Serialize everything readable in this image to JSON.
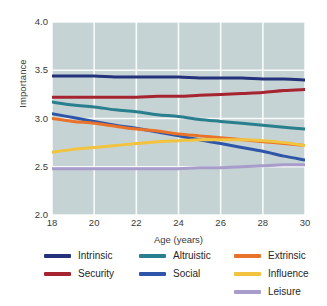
{
  "chart_data": {
    "type": "line",
    "title": "",
    "xlabel": "Age (years)",
    "ylabel": "Importance",
    "xlim": [
      18,
      30
    ],
    "ylim": [
      2.0,
      4.0
    ],
    "xticks": [
      "18",
      "20",
      "22",
      "24",
      "26",
      "28",
      "30"
    ],
    "yticks": [
      "2.0",
      "2.5",
      "3.0",
      "3.5",
      "4.0"
    ],
    "grid": true,
    "legend_position": "bottom",
    "plot_background": "#c6d3d4",
    "x": [
      18,
      19,
      20,
      21,
      22,
      23,
      24,
      25,
      26,
      27,
      28,
      29,
      30
    ],
    "series": [
      {
        "name": "Intrinsic",
        "color": "#24327c",
        "values": [
          3.44,
          3.44,
          3.44,
          3.43,
          3.43,
          3.43,
          3.43,
          3.42,
          3.42,
          3.42,
          3.41,
          3.41,
          3.4
        ]
      },
      {
        "name": "Security",
        "color": "#a6242f",
        "values": [
          3.22,
          3.22,
          3.22,
          3.22,
          3.22,
          3.23,
          3.23,
          3.24,
          3.25,
          3.26,
          3.27,
          3.29,
          3.3
        ]
      },
      {
        "name": "Altruistic",
        "color": "#2a7f8e",
        "values": [
          3.17,
          3.14,
          3.12,
          3.09,
          3.07,
          3.04,
          3.02,
          2.99,
          2.97,
          2.95,
          2.93,
          2.91,
          2.89
        ]
      },
      {
        "name": "Social",
        "color": "#2f55a8",
        "values": [
          3.05,
          3.01,
          2.97,
          2.93,
          2.9,
          2.86,
          2.82,
          2.78,
          2.74,
          2.7,
          2.66,
          2.61,
          2.57
        ]
      },
      {
        "name": "Extrinsic",
        "color": "#e8722a",
        "values": [
          3.0,
          2.97,
          2.95,
          2.92,
          2.89,
          2.87,
          2.84,
          2.82,
          2.8,
          2.78,
          2.76,
          2.74,
          2.72
        ]
      },
      {
        "name": "Influence",
        "color": "#f1c33e",
        "values": [
          2.65,
          2.68,
          2.7,
          2.72,
          2.74,
          2.76,
          2.77,
          2.78,
          2.78,
          2.78,
          2.77,
          2.75,
          2.72
        ]
      },
      {
        "name": "Leisure",
        "color": "#a89ccb",
        "values": [
          2.48,
          2.48,
          2.48,
          2.48,
          2.48,
          2.48,
          2.48,
          2.49,
          2.49,
          2.5,
          2.51,
          2.52,
          2.52
        ]
      }
    ]
  },
  "legend": {
    "columns": [
      [
        "Intrinsic",
        "Security"
      ],
      [
        "Altruistic",
        "Social"
      ],
      [
        "Extrinsic",
        "Influence",
        "Leisure"
      ]
    ]
  }
}
